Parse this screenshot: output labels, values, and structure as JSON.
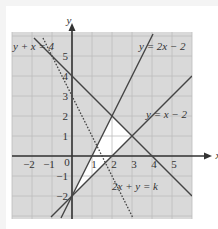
{
  "chart_data": {
    "type": "line",
    "title": "",
    "xlabel": "x",
    "ylabel": "y",
    "xlim": [
      -3,
      6
    ],
    "ylim": [
      -3.15,
      6.2
    ],
    "grid": true,
    "x_ticks": [
      -2,
      -1,
      0,
      1,
      2,
      3,
      4,
      5
    ],
    "y_ticks": [
      -2,
      -1,
      1,
      2,
      3,
      4,
      5
    ],
    "series": [
      {
        "name": "y + x = 4",
        "style": "solid",
        "points": [
          [
            -1.9,
            5.9
          ],
          [
            6,
            -2
          ]
        ]
      },
      {
        "name": "y = 2x - 2",
        "style": "solid",
        "points": [
          [
            -0.55,
            -3.1
          ],
          [
            4.05,
            6.1
          ]
        ]
      },
      {
        "name": "y = x - 2",
        "style": "solid",
        "points": [
          [
            -1.05,
            -3.05
          ],
          [
            6,
            4
          ]
        ]
      },
      {
        "name": "2x + y = k",
        "style": "dashed",
        "k": 3,
        "points": [
          [
            -1.45,
            5.9
          ],
          [
            3.05,
            -3.1
          ]
        ]
      }
    ],
    "feasible_region": {
      "fill": "#ffffff",
      "vertices": [
        [
          0,
          -2
        ],
        [
          2,
          2
        ],
        [
          3,
          1
        ]
      ]
    },
    "annotations": [
      {
        "text": "y + x = 4",
        "at": [
          -2.95,
          5.3
        ]
      },
      {
        "text": "y = 2x − 2",
        "at": [
          3.35,
          5.3
        ]
      },
      {
        "text": "y = x − 2",
        "at": [
          3.7,
          1.9
        ]
      },
      {
        "text": "2x + y = k",
        "at": [
          2.0,
          -1.7
        ]
      }
    ]
  },
  "colors": {
    "region_fill": "#d9d9d9",
    "gridline": "#bdbdbd",
    "line": "#444444",
    "axis": "#333333",
    "feasible": "#ffffff"
  },
  "labels": {
    "x_axis": "x",
    "y_axis": "y",
    "origin": "0"
  }
}
